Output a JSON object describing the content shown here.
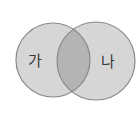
{
  "diagram": {
    "type": "venn",
    "sets": [
      {
        "id": "left",
        "label": "가",
        "cx": 53,
        "cy": 60,
        "r": 37
      },
      {
        "id": "right",
        "label": "나",
        "cx": 96,
        "cy": 61,
        "r": 39
      }
    ],
    "colors": {
      "circle_fill": "#d6d6d6",
      "intersection_fill": "#b4b4b4",
      "stroke": "#8a8a8a",
      "background": "#ffffff"
    }
  }
}
